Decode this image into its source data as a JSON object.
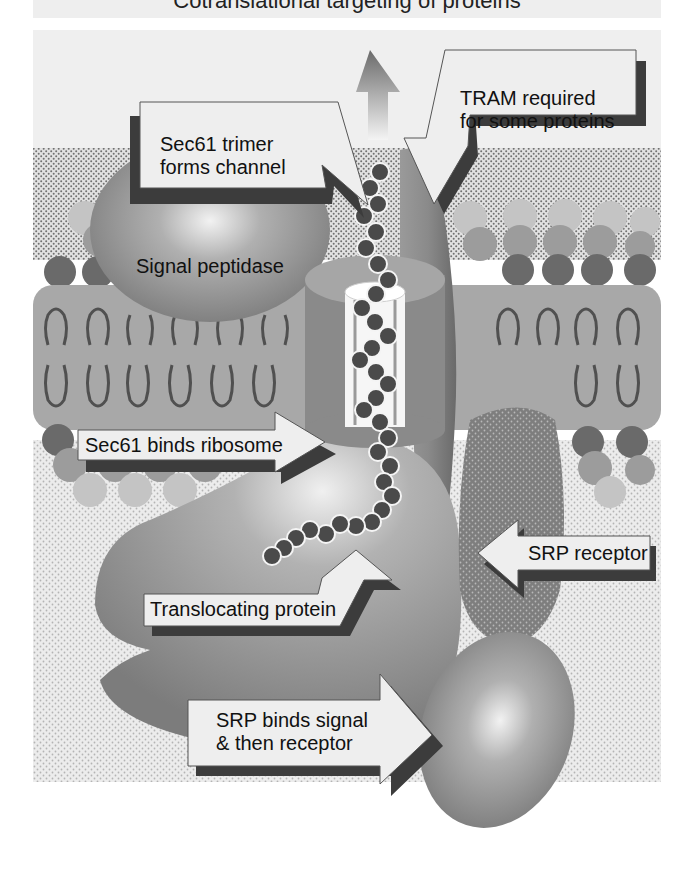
{
  "figure": {
    "title_cropped": "Cotranslational targeting of proteins",
    "labels": {
      "sec61_trimer": [
        "Sec61 trimer",
        "forms channel"
      ],
      "tram": [
        "TRAM required",
        "for some proteins"
      ],
      "signal_peptidase": "Signal peptidase",
      "sec61_binds": "Sec61 binds ribosome",
      "srp_receptor": "SRP receptor",
      "translocating": "Translocating protein",
      "srp_binds": [
        "SRP binds signal",
        "& then receptor"
      ]
    },
    "components": [
      "signal-peptidase",
      "sec61-channel",
      "tram",
      "lipid-bilayer",
      "ribosome",
      "translocating-polypeptide",
      "srp-receptor",
      "srp",
      "export-arrow"
    ],
    "colors": {
      "background_stipple": "#e6e6e6",
      "lumen_dots": "#9a9a9a",
      "membrane_fill": "#a8a8a8",
      "lipid_head_dark": "#6a6a6a",
      "lipid_head_mid": "#9c9c9c",
      "lipid_head_light": "#c4c4c4",
      "lipid_tail": "#505050",
      "protein_grey": "#8e8e8e",
      "amino_acid_bead": "#4a4a4a",
      "label_box": "#eeeeee",
      "label_shadow": "#3c3c3c"
    }
  }
}
